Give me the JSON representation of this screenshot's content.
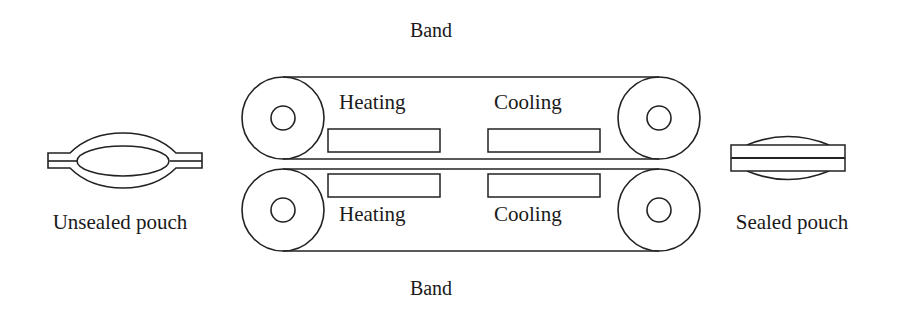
{
  "diagram": {
    "type": "band-sealer-schematic",
    "labels": {
      "band_top": "Band",
      "band_bottom": "Band",
      "unsealed": "Unsealed pouch",
      "sealed": "Sealed pouch"
    },
    "upper_band": {
      "zones": [
        {
          "label": "Heating"
        },
        {
          "label": "Cooling"
        }
      ]
    },
    "lower_band": {
      "zones": [
        {
          "label": "Heating"
        },
        {
          "label": "Cooling"
        }
      ]
    },
    "colors": {
      "line": "#222222",
      "text": "#1a1a1a",
      "background": "#ffffff"
    }
  }
}
